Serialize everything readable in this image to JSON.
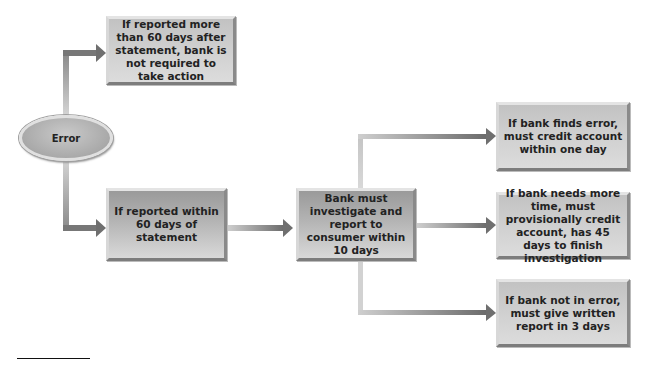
{
  "diagram": {
    "type": "flowchart",
    "start": {
      "label": "Error"
    },
    "boxes": {
      "late_report": {
        "label": "If reported more than 60 days after statement, bank is not required to take action"
      },
      "timely_report": {
        "label": "If reported within 60 days of statement"
      },
      "investigate": {
        "label": "Bank must investigate and report  to consumer within 10 days"
      },
      "finds_error": {
        "label": "If bank finds error, must credit account within one day"
      },
      "more_time": {
        "label": "If bank needs more time, must provisionally credit account, has 45 days to finish investigation"
      },
      "not_in_error": {
        "label": "If bank not in error, must give written report in 3 days"
      }
    },
    "edges": [
      {
        "from": "Error",
        "to": "If reported more than 60 days after statement, bank is not required to take action"
      },
      {
        "from": "Error",
        "to": "If reported within 60 days of statement"
      },
      {
        "from": "If reported within 60 days of statement",
        "to": "Bank must investigate and report to consumer within 10 days"
      },
      {
        "from": "Bank must investigate and report to consumer within 10 days",
        "to": "If bank finds error, must credit account within one day"
      },
      {
        "from": "Bank must investigate and report to consumer within 10 days",
        "to": "If bank needs more time, must provisionally credit account, has 45 days to finish investigation"
      },
      {
        "from": "Bank must investigate and report to consumer within 10 days",
        "to": "If bank not in error, must give written report in 3 days"
      }
    ],
    "colors": {
      "arrow_dark": "#6f6f6f",
      "arrow_light": "#d0d0d0",
      "box_fill": "#b8b8b8"
    }
  }
}
